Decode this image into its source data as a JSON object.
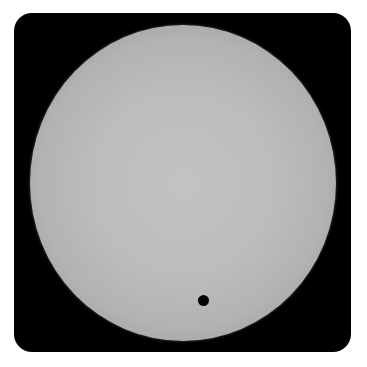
{
  "image": {
    "subject": "sun-disc-with-planetary-transit",
    "colors": {
      "frame": "#000000",
      "sun_center": "#c2c2c2",
      "sun_limb": "#6a6a6a",
      "planet": "#000000",
      "background": "#ffffff"
    }
  }
}
